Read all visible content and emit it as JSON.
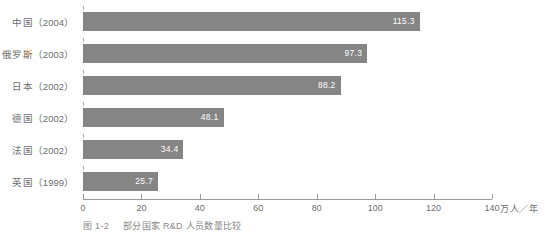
{
  "chart_data": {
    "type": "bar",
    "orientation": "horizontal",
    "title": "",
    "xlabel": "万人／年",
    "ylabel": "",
    "xlim": [
      0,
      140
    ],
    "xticks": [
      0,
      20,
      40,
      60,
      80,
      100,
      120,
      140
    ],
    "grid": false,
    "legend": null,
    "bar_color": "#858585",
    "value_label_color": "#ffffff",
    "categories": [
      "中国（2004）",
      "俄罗斯（2003）",
      "日本（2002）",
      "德国（2002）",
      "法国（2002）",
      "英国（1999）"
    ],
    "values": [
      115.3,
      97.3,
      88.2,
      48.1,
      34.4,
      25.7
    ],
    "bars": [
      {
        "country": "中国",
        "year": "（2004）",
        "value": 115.3,
        "label": "115.3"
      },
      {
        "country": "俄罗斯",
        "year": "（2003）",
        "value": 97.3,
        "label": "97.3"
      },
      {
        "country": "日本",
        "year": "（2002）",
        "value": 88.2,
        "label": "88.2"
      },
      {
        "country": "德国",
        "year": "（2002）",
        "value": 48.1,
        "label": "48.1"
      },
      {
        "country": "法国",
        "year": "（2002）",
        "value": 34.4,
        "label": "34.4"
      },
      {
        "country": "英国",
        "year": "（1999）",
        "value": 25.7,
        "label": "25.7"
      }
    ]
  },
  "axis": {
    "tick_labels": [
      "0",
      "20",
      "40",
      "60",
      "80",
      "100",
      "120",
      "140"
    ],
    "unit": "万人／年"
  },
  "caption": {
    "number": "图 1-2",
    "text": "部分国家 R&D 人员数量比较"
  }
}
